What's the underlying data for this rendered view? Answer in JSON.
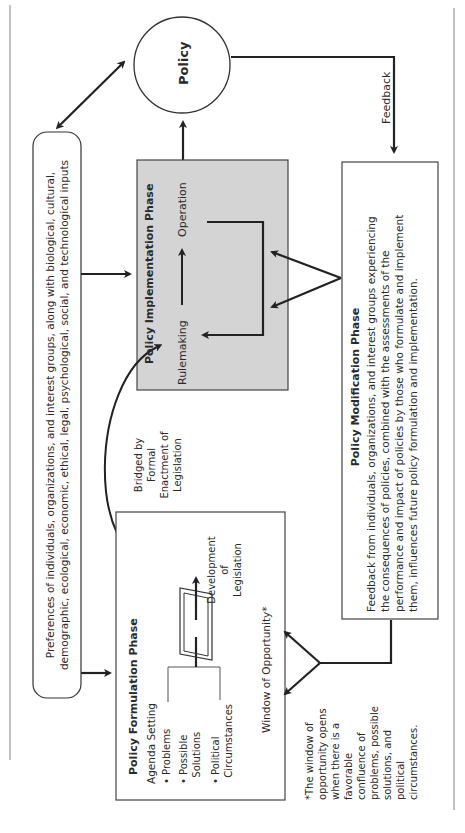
{
  "diagram": {
    "policy_node": {
      "label": "Policy"
    },
    "feedback_label": "Feedback",
    "inputs_box": {
      "lines": [
        "Preferences of individuals, organizations, and interest groups, along with biological, cultural,",
        "demographic, ecological, economic, ethical, legal, psychological, social, and technological inputs"
      ]
    },
    "implementation_phase": {
      "title": "Policy Implementation Phase",
      "steps": [
        "Rulemaking",
        "Operation"
      ],
      "fill_color": "#d4d4d4"
    },
    "bridge_label": [
      "Bridged by",
      "Formal",
      "Enactment of",
      "Legislation"
    ],
    "formulation_phase": {
      "title": "Policy Formulation Phase",
      "agenda_setting_label": "Agenda Setting",
      "agenda_items": [
        [
          "Problems"
        ],
        [
          "Possible",
          "Solutions"
        ],
        [
          "Political",
          "Circumstances"
        ]
      ],
      "development_label": [
        "Development",
        "of",
        "Legislation"
      ],
      "window_label": "Window of Opportunity*"
    },
    "modification_phase": {
      "title": "Policy Modification Phase",
      "lines": [
        "Feedback from individuals, organizations, and interest groups experiencing",
        "the consequences of policies, combined with the assessments of the",
        "performance and impact of policies by those who formulate and implement",
        "them, influences future policy formulation and implementation."
      ]
    },
    "footnote": {
      "lines": [
        "*The window of",
        "opportunity opens",
        "when there is a",
        "favorable",
        "confluence of",
        "problems, possible",
        "solutions, and",
        "political",
        "circumstances."
      ]
    },
    "colors": {
      "line": "#222222",
      "border": "#555555",
      "rule": "#999999"
    }
  }
}
